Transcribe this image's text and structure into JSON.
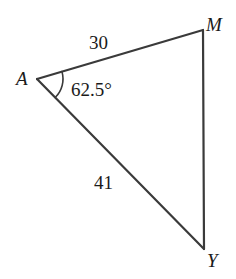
{
  "figure": {
    "type": "triangle-diagram",
    "background_color": "#ffffff",
    "stroke_color": "#3a3a3a",
    "text_color": "#1a1a1a",
    "stroke_width": 2.2,
    "vertices": [
      {
        "name": "A",
        "label": "A",
        "x": 37,
        "y": 79
      },
      {
        "name": "M",
        "label": "M",
        "x": 203,
        "y": 30
      },
      {
        "name": "Y",
        "label": "Y",
        "x": 204,
        "y": 249
      }
    ],
    "sides": [
      {
        "name": "AM",
        "label": "30",
        "from": "A",
        "to": "M"
      },
      {
        "name": "AY",
        "label": "41",
        "from": "A",
        "to": "Y"
      },
      {
        "name": "MY",
        "label": "",
        "from": "M",
        "to": "Y"
      }
    ],
    "angles": [
      {
        "name": "A",
        "label": "62.5°",
        "at_vertex": "A",
        "arc_radius": 26
      }
    ]
  }
}
